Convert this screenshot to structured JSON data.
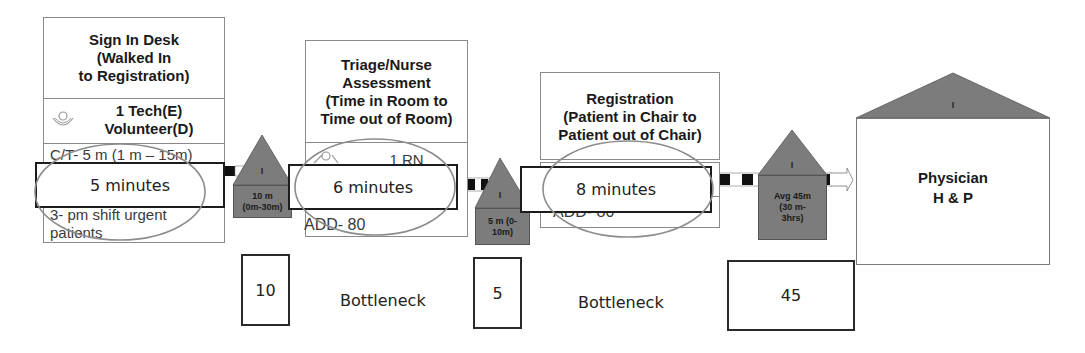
{
  "processes": [
    {
      "id": "sign-in-desk",
      "title": "Sign In Desk (Walked In to Registration)",
      "title_lines": [
        "Sign In Desk",
        "(Walked In",
        "to Registration)"
      ],
      "staff_lines": [
        "1 Tech(E)",
        "Volunteer(D)"
      ],
      "data_lines": [
        "C/T- 5 m (1 m – 15m)",
        "3- pm shift urgent",
        "patients"
      ],
      "highlight": "5 minutes"
    },
    {
      "id": "triage-nurse-assessment",
      "title": "Triage/Nurse Assessment (Time in Room to Time out of Room)",
      "title_lines": [
        "Triage/Nurse",
        "Assessment",
        "(Time in Room to",
        "Time out of Room)"
      ],
      "staff_lines": [
        "1 RN"
      ],
      "data_lines": [
        "ADD- 80"
      ],
      "highlight": "6 minutes"
    },
    {
      "id": "registration",
      "title": "Registration (Patient in Chair to Patient out of Chair)",
      "title_lines": [
        "Registration",
        "(Patient in Chair to",
        "Patient out of Chair)"
      ],
      "staff_lines": [],
      "data_lines": [
        "ADD- 80"
      ],
      "highlight": "8 minutes"
    },
    {
      "id": "physician-hp",
      "title_lines": [
        "Physician",
        "H & P"
      ],
      "roof_label": "I"
    }
  ],
  "inventories": [
    {
      "label": "I",
      "wait_lines": [
        "10 m",
        "(0m-30m)"
      ]
    },
    {
      "label": "I",
      "wait_lines": [
        "5 m (0-",
        "10m)"
      ]
    },
    {
      "label": "I",
      "wait_lines": [
        "Avg 45m",
        "(30 m-",
        "3hrs)"
      ]
    }
  ],
  "wait_values": [
    "10",
    "5",
    "45"
  ],
  "bottleneck_labels": [
    "Bottleneck",
    "Bottleneck"
  ],
  "colors": {
    "inventory_fill": "#7c7c7c",
    "ellipse_stroke": "#8c8c8c",
    "box_border": "#8a8a8a"
  }
}
